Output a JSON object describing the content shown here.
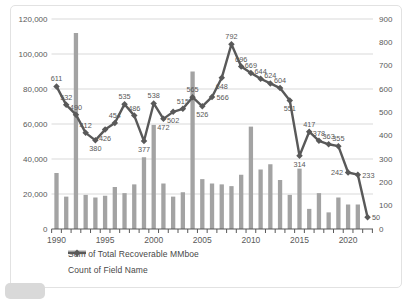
{
  "chart_data": {
    "type": "combo-bar-line",
    "title": "",
    "x": [
      1990,
      1991,
      1992,
      1993,
      1994,
      1995,
      1996,
      1997,
      1998,
      1999,
      2000,
      2001,
      2002,
      2003,
      2004,
      2005,
      2006,
      2007,
      2008,
      2009,
      2010,
      2011,
      2012,
      2013,
      2014,
      2015,
      2016,
      2017,
      2018,
      2019,
      2020,
      2021,
      2022
    ],
    "x_axis": {
      "tick_labels": [
        "1990",
        "1995",
        "2000",
        "2005",
        "2010",
        "2015",
        "2020"
      ],
      "tick_years": [
        1990,
        1995,
        2000,
        2005,
        2010,
        2015,
        2020
      ]
    },
    "left_axis": {
      "min": 0,
      "max": 120000,
      "step": 20000,
      "tick_labels": [
        "0",
        "20,000",
        "40,000",
        "60,000",
        "80,000",
        "100,000",
        "120,000"
      ]
    },
    "right_axis": {
      "min": 0,
      "max": 900,
      "step": 100,
      "tick_labels": [
        "0",
        "100",
        "200",
        "300",
        "400",
        "500",
        "600",
        "700",
        "800",
        "900"
      ]
    },
    "grid": "horizontal",
    "legend_position": "bottom-left",
    "series": [
      {
        "name": "Sum of Total Recoverable MMboe",
        "type": "bar",
        "axis": "left",
        "color": "#a3a3a3",
        "values": [
          32000,
          18500,
          112000,
          19500,
          18000,
          19000,
          24000,
          20500,
          25500,
          41000,
          59500,
          26000,
          18500,
          21000,
          90000,
          28500,
          26000,
          25500,
          24500,
          31000,
          58500,
          34000,
          37000,
          28000,
          19500,
          34500,
          11500,
          20500,
          9500,
          18000,
          14000,
          14000,
          0
        ]
      },
      {
        "name": "Count of Field Name",
        "type": "line",
        "axis": "right",
        "color": "#595959",
        "marker": "diamond",
        "values": [
          611,
          532,
          490,
          412,
          380,
          426,
          454,
          535,
          486,
          377,
          538,
          472,
          502,
          515,
          565,
          526,
          566,
          648,
          792,
          696,
          669,
          644,
          624,
          604,
          551,
          314,
          417,
          378,
          363,
          355,
          242,
          233,
          50
        ],
        "data_labels_visible": true,
        "label_pos": [
          "a",
          "a",
          "a",
          "a",
          "b",
          "b",
          "a",
          "a",
          "a",
          "b",
          "a",
          "b",
          "b",
          "a",
          "a",
          "b",
          "r",
          "b",
          "a",
          "a",
          "a",
          "a",
          "a",
          "a",
          "b",
          "b",
          "a",
          "a",
          "a",
          "a",
          "l",
          "r",
          "r"
        ]
      }
    ],
    "colors": {
      "grid_line": "#d9d9d9",
      "axis_line": "#595959",
      "axis_text": "#595959",
      "data_label_text": "#595959",
      "legend_text": "#474747",
      "frame_border": "#e2e2e2"
    }
  }
}
